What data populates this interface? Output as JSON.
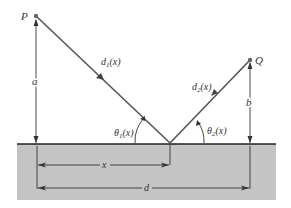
{
  "diagram": {
    "points": {
      "P": {
        "label": "P",
        "x": 36,
        "y": 16
      },
      "Q": {
        "label": "Q",
        "x": 250,
        "y": 60
      },
      "R": {
        "x": 170,
        "y": 143
      }
    },
    "labels": {
      "P": "P",
      "Q": "Q",
      "a": "a",
      "b": "b",
      "d1": "d",
      "d1_sub": "1",
      "d1_arg": "(x)",
      "d2": "d",
      "d2_sub": "2",
      "d2_arg": "(x)",
      "theta1": "θ",
      "theta1_sub": "1",
      "theta1_arg": "(x)",
      "theta2": "θ",
      "theta2_sub": "2",
      "theta2_arg": "(x)",
      "x": "x",
      "d": "d"
    },
    "colors": {
      "ray": "#555555",
      "surface_fill": "#c4c4c4",
      "surface_line": "#222222",
      "dimension": "#333333",
      "point": "#666666"
    }
  }
}
